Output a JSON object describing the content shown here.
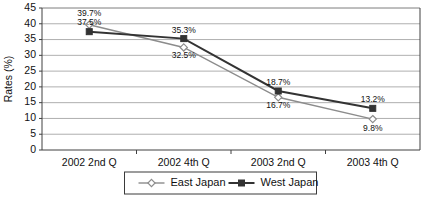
{
  "chart_data": {
    "type": "line",
    "title": "",
    "xlabel": "",
    "ylabel": "Rates (%)",
    "categories": [
      "2002 2nd Q",
      "2002 4th Q",
      "2003 2nd Q",
      "2003 4th Q"
    ],
    "ylim": [
      0,
      45
    ],
    "yticks": [
      0,
      5,
      10,
      15,
      20,
      25,
      30,
      35,
      40,
      45
    ],
    "ytick_labels": [
      "0",
      "5",
      "10",
      "15",
      "20",
      "25",
      "30",
      "35",
      "40",
      "45"
    ],
    "grid": true,
    "legend_position": "bottom",
    "series": [
      {
        "name": "East Japan",
        "values": [
          39.7,
          32.5,
          16.7,
          9.8
        ],
        "labels": [
          "39.7%",
          "32.5%",
          "16.7%",
          "9.8%"
        ],
        "color": "#8c8c8c",
        "marker": "diamond"
      },
      {
        "name": "West Japan",
        "values": [
          37.5,
          35.3,
          18.7,
          13.2
        ],
        "labels": [
          "37.5%",
          "35.3%",
          "18.7%",
          "13.2%"
        ],
        "color": "#333333",
        "marker": "square"
      }
    ]
  },
  "legend": {
    "items": [
      {
        "label": "East Japan",
        "marker_name": "diamond-marker"
      },
      {
        "label": "West Japan",
        "marker_name": "square-marker"
      }
    ]
  },
  "axes": {
    "y_title": "Rates (%)"
  }
}
